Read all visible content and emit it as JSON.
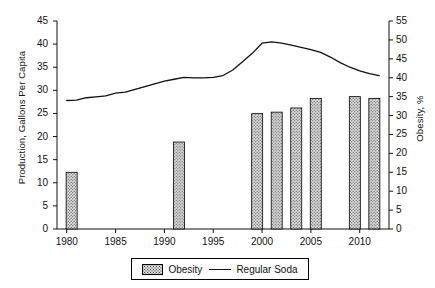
{
  "chart_data": {
    "type": "bar",
    "title": "",
    "subtitle": "",
    "xlabel": "",
    "ylabel": "Production, Gallons Per Capita",
    "ylabel_right": "Obesity, %",
    "xlim": [
      1979,
      2013
    ],
    "ylim": [
      0,
      45
    ],
    "ylim_right": [
      0,
      55
    ],
    "grid": false,
    "legend_position": "bottom-center",
    "xticks": [
      1980,
      1985,
      1990,
      1995,
      2000,
      2005,
      2010
    ],
    "xtick_labels": [
      "1980",
      "1985",
      "1990",
      "1995",
      "2000",
      "2005",
      "2010"
    ],
    "yticks_left": [
      0,
      5,
      10,
      15,
      20,
      25,
      30,
      35,
      40,
      45
    ],
    "ytick_labels_left": [
      "0",
      "5",
      "10",
      "15",
      "20",
      "25",
      "30",
      "35",
      "40",
      "45"
    ],
    "yticks_right": [
      0,
      5,
      10,
      15,
      20,
      25,
      30,
      35,
      40,
      45,
      50,
      55
    ],
    "ytick_labels_right": [
      "0",
      "5",
      "10",
      "15",
      "20",
      "25",
      "30",
      "35",
      "40",
      "45",
      "50",
      "55"
    ],
    "series": [
      {
        "name": "Obesity",
        "type": "bar",
        "axis": "right",
        "unit": "%",
        "x": [
          1980.5,
          1991.5,
          1999.5,
          2001.5,
          2003.5,
          2005.5,
          2009.5,
          2011.5
        ],
        "values": [
          15.0,
          23.0,
          30.5,
          30.9,
          32.0,
          34.5,
          35.0,
          34.5
        ]
      },
      {
        "name": "Regular Soda",
        "type": "line",
        "axis": "left",
        "unit": "gallons per capita",
        "x": [
          1980,
          1981,
          1982,
          1983,
          1984,
          1985,
          1986,
          1987,
          1988,
          1989,
          1990,
          1991,
          1992,
          1993,
          1994,
          1995,
          1996,
          1997,
          1998,
          1999,
          2000,
          2001,
          2002,
          2003,
          2004,
          2005,
          2006,
          2007,
          2008,
          2009,
          2010,
          2011,
          2012
        ],
        "values": [
          27.8,
          27.9,
          28.4,
          28.6,
          28.8,
          29.4,
          29.6,
          30.2,
          30.8,
          31.4,
          32.0,
          32.4,
          32.8,
          32.7,
          32.7,
          32.8,
          33.2,
          34.4,
          36.2,
          38.0,
          40.2,
          40.5,
          40.2,
          39.8,
          39.3,
          38.8,
          38.2,
          37.2,
          36.0,
          35.0,
          34.2,
          33.6,
          33.2
        ]
      }
    ],
    "legend": [
      {
        "label": "Obesity",
        "marker": "hatched-bar",
        "color": "#d8d8d8"
      },
      {
        "label": "Regular Soda",
        "marker": "line",
        "color": "#111111"
      }
    ],
    "colors": {
      "bar_fill": "#d8d8d8",
      "bar_pattern": "#4a4a4a",
      "bar_edge": "#000000",
      "line": "#111111",
      "axis": "#111111",
      "background": "#ffffff"
    }
  }
}
